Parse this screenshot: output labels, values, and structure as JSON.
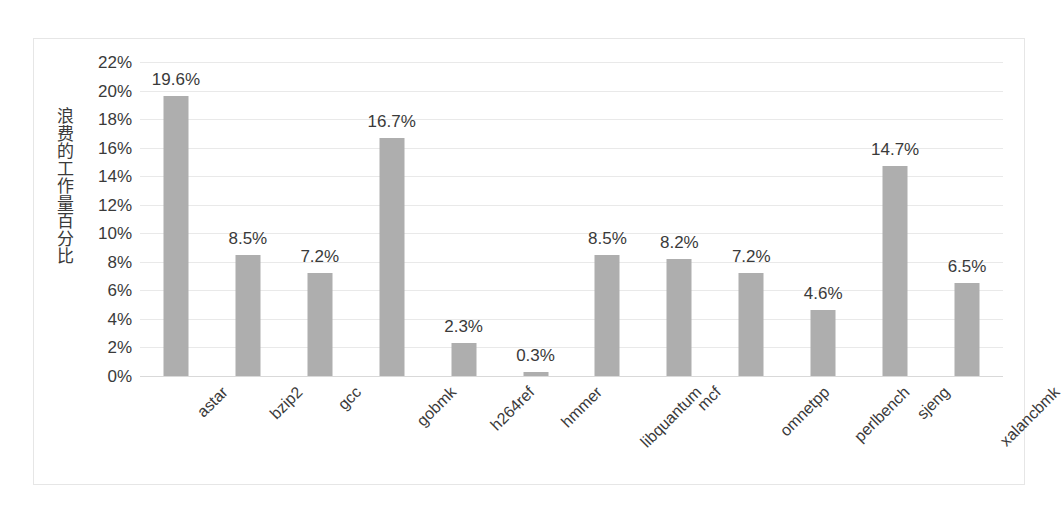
{
  "chart_data": {
    "type": "bar",
    "title": "",
    "subtitle": "",
    "xlabel": "",
    "ylabel": "浪费的工作量百分比",
    "ylabel_chars": [
      "浪",
      "费",
      "的",
      "工",
      "作",
      "量",
      "百",
      "分",
      "比"
    ],
    "categories": [
      "astar",
      "bzip2",
      "gcc",
      "gobmk",
      "h264ref",
      "hmmer",
      "libquantum",
      "mcf",
      "omnetpp",
      "perlbench",
      "sjeng",
      "xalancbmk"
    ],
    "values": [
      19.6,
      8.5,
      7.2,
      16.7,
      2.3,
      0.3,
      8.5,
      8.2,
      7.2,
      4.6,
      14.7,
      6.5
    ],
    "data_labels": [
      "19.6%",
      "8.5%",
      "7.2%",
      "16.7%",
      "2.3%",
      "0.3%",
      "8.5%",
      "8.2%",
      "7.2%",
      "4.6%",
      "14.7%",
      "6.5%"
    ],
    "ylim": [
      0,
      22
    ],
    "ytick_step": 2,
    "ytick_labels": [
      "0%",
      "2%",
      "4%",
      "6%",
      "8%",
      "10%",
      "12%",
      "14%",
      "16%",
      "18%",
      "20%",
      "22%"
    ],
    "ytick_values": [
      0,
      2,
      4,
      6,
      8,
      10,
      12,
      14,
      16,
      18,
      20,
      22
    ],
    "grid": true,
    "grid_axis": "y",
    "legend": false,
    "legend_position": "none",
    "bar_color": "#aeaeae",
    "grid_color": "#e9e9e9",
    "text_color": "#3a3a3a",
    "frame_color": "#e6e6e6",
    "background": "#ffffff",
    "category_label_rotation": -45
  }
}
